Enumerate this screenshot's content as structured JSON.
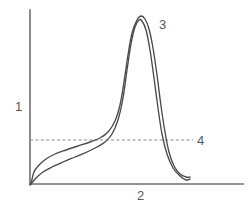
{
  "figure": {
    "background_color": "#ffffff",
    "width": 252,
    "height": 210
  },
  "axes": {
    "y_axis": {
      "label": "1",
      "name": "y-axis",
      "x": 30,
      "y_top": 10,
      "y_bottom": 185,
      "color": "#6e6e6e"
    },
    "x_axis": {
      "label": "2",
      "name": "x-axis",
      "y": 184,
      "x_left": 30,
      "x_right": 243,
      "color": "#6e6e6e"
    }
  },
  "annotations": [
    {
      "id": "1",
      "label": "1",
      "role": "y-axis-label",
      "x": 15,
      "y": 100
    },
    {
      "id": "2",
      "label": "2",
      "role": "x-axis-label",
      "x": 137,
      "y": 189
    },
    {
      "id": "3",
      "label": "3",
      "role": "peak-label",
      "x": 159,
      "y": 18
    },
    {
      "id": "4",
      "label": "4",
      "role": "threshold-line-label",
      "x": 197,
      "y": 134
    }
  ],
  "threshold": {
    "label": "4",
    "y": 140,
    "x_start": 30,
    "x_end": 193,
    "style": "dashed",
    "color": "#8a8a8a"
  },
  "chart_data": {
    "type": "line",
    "xlabel": "2",
    "ylabel": "1",
    "grid": false,
    "legend": null,
    "xlim": [
      30,
      243
    ],
    "ylim": [
      184,
      10
    ],
    "annotations": [
      {
        "text": "1",
        "target": "y-axis",
        "x": 15,
        "y": 100
      },
      {
        "text": "2",
        "target": "x-axis",
        "x": 137,
        "y": 189
      },
      {
        "text": "3",
        "target": "peak",
        "x": 159,
        "y": 18
      },
      {
        "text": "4",
        "target": "threshold-line",
        "x": 197,
        "y": 134
      }
    ],
    "reference_lines": [
      {
        "orientation": "horizontal",
        "value": 140,
        "style": "dashed",
        "label": "4"
      }
    ],
    "series": [
      {
        "name": "upper-trace",
        "color": "#4a4a4a",
        "points": [
          [
            31,
            184
          ],
          [
            34,
            172
          ],
          [
            39,
            165
          ],
          [
            46,
            159
          ],
          [
            55,
            154
          ],
          [
            66,
            150
          ],
          [
            78,
            146
          ],
          [
            90,
            142
          ],
          [
            100,
            138
          ],
          [
            108,
            132
          ],
          [
            115,
            121
          ],
          [
            120,
            105
          ],
          [
            124,
            82
          ],
          [
            128,
            55
          ],
          [
            132,
            33
          ],
          [
            137,
            20
          ],
          [
            141,
            16
          ],
          [
            145,
            19
          ],
          [
            149,
            29
          ],
          [
            153,
            48
          ],
          [
            157,
            75
          ],
          [
            161,
            106
          ],
          [
            165,
            132
          ],
          [
            169,
            152
          ],
          [
            174,
            166
          ],
          [
            180,
            174
          ],
          [
            186,
            177
          ],
          [
            190,
            177
          ]
        ]
      },
      {
        "name": "lower-trace",
        "color": "#4a4a4a",
        "points": [
          [
            31,
            184
          ],
          [
            36,
            178
          ],
          [
            43,
            172
          ],
          [
            52,
            167
          ],
          [
            63,
            162
          ],
          [
            75,
            157
          ],
          [
            87,
            152
          ],
          [
            97,
            147
          ],
          [
            105,
            142
          ],
          [
            112,
            134
          ],
          [
            118,
            120
          ],
          [
            123,
            98
          ],
          [
            127,
            70
          ],
          [
            131,
            44
          ],
          [
            135,
            27
          ],
          [
            139,
            20
          ],
          [
            142,
            21
          ],
          [
            146,
            30
          ],
          [
            150,
            50
          ],
          [
            154,
            78
          ],
          [
            158,
            108
          ],
          [
            162,
            134
          ],
          [
            167,
            154
          ],
          [
            173,
            168
          ],
          [
            180,
            176
          ],
          [
            186,
            180
          ],
          [
            190,
            179
          ]
        ]
      }
    ]
  }
}
